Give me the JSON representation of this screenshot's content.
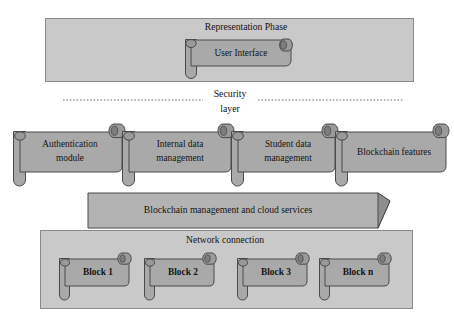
{
  "diagram": {
    "canvas": {
      "width": 454,
      "height": 320,
      "background": "#ffffff"
    },
    "colors": {
      "panel_fill": "#c9c9c9",
      "panel_stroke": "#8a8a8a",
      "scroll_fill": "#a9a9a9",
      "scroll_stroke": "#4a4a4a",
      "roll_fill": "#9a9a9a",
      "roll_shadow": "#7d7d7d",
      "banner_fill": "#b3b3b3",
      "banner_fold": "#8e8e8e",
      "banner_stroke": "#4a4a4a",
      "text": "#141414",
      "dash_line": "#6e6e6e"
    }
  },
  "representation_panel": {
    "name": "representation-phase-panel",
    "label": "Representation Phase",
    "child": {
      "name": "user-interface-scroll",
      "label": "User Interface"
    }
  },
  "security_layer": {
    "name": "security-layer-divider",
    "label_line1": "Security",
    "label_line2": "layer",
    "dashes": true
  },
  "modules": {
    "name": "module-row",
    "items": [
      {
        "id": "authentication-module",
        "line1": "Authentication",
        "line2": "module"
      },
      {
        "id": "internal-data-management",
        "line1": "Internal data",
        "line2": "management"
      },
      {
        "id": "student-data-management",
        "line1": "Student data",
        "line2": "management"
      },
      {
        "id": "blockchain-features",
        "line1": "Blockchain features",
        "line2": ""
      }
    ]
  },
  "services_banner": {
    "name": "blockchain-management-banner",
    "label": "Blockchain management and cloud services"
  },
  "network_panel": {
    "name": "network-connection-panel",
    "label": "Network connection",
    "blocks": [
      {
        "id": "block-1",
        "label": "Block 1"
      },
      {
        "id": "block-2",
        "label": "Block 2"
      },
      {
        "id": "block-3",
        "label": "Block 3"
      },
      {
        "id": "block-n",
        "label": "Block n"
      }
    ]
  }
}
